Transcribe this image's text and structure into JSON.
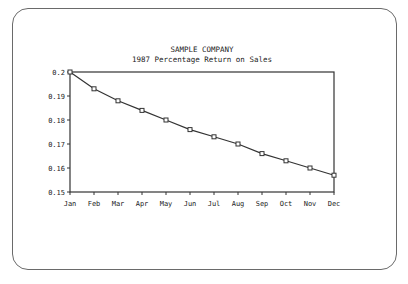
{
  "chart_data": {
    "type": "line",
    "title": "SAMPLE COMPANY",
    "subtitle": "1987 Percentage Return on Sales",
    "xlabel": "",
    "ylabel": "",
    "categories": [
      "Jan",
      "Feb",
      "Mar",
      "Apr",
      "May",
      "Jun",
      "Jul",
      "Aug",
      "Sep",
      "Oct",
      "Nov",
      "Dec"
    ],
    "series": [
      {
        "name": "Percentage Return on Sales",
        "values": [
          0.2,
          0.193,
          0.188,
          0.184,
          0.18,
          0.176,
          0.173,
          0.17,
          0.166,
          0.163,
          0.16,
          0.157
        ],
        "marker": "square",
        "color": "#333333"
      }
    ],
    "ylim": [
      0.15,
      0.2
    ],
    "yticks": [
      "0.2",
      "0.19",
      "0.18",
      "0.17",
      "0.16",
      "0.15"
    ],
    "grid": false,
    "legend": null
  }
}
